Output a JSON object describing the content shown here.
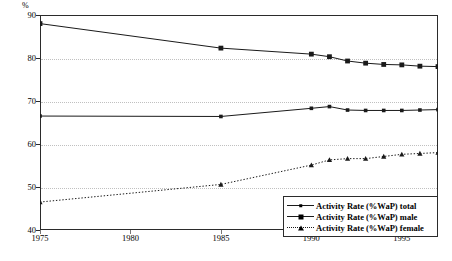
{
  "figure": {
    "cropped_title_text": "",
    "y_axis_unit_label": "%"
  },
  "chart_data": {
    "type": "line",
    "title": "",
    "xlabel": "",
    "ylabel": "%",
    "xlim": [
      1975,
      1997
    ],
    "ylim": [
      40,
      90
    ],
    "yticks": [
      40,
      50,
      60,
      70,
      80,
      90
    ],
    "xticks": [
      1975,
      1980,
      1985,
      1990,
      1995
    ],
    "grid": "horizontal-dotted",
    "legend_position": "bottom-right",
    "x": [
      1975,
      1985,
      1990,
      1991,
      1992,
      1993,
      1994,
      1995,
      1996,
      1997
    ],
    "series": [
      {
        "name": "Activity Rate (%WaP) total",
        "marker": "small-square",
        "line": "solid",
        "color": "#1a1a1a",
        "values": [
          66.5,
          66.4,
          68.3,
          68.7,
          67.9,
          67.8,
          67.8,
          67.8,
          67.9,
          68.0
        ]
      },
      {
        "name": "Activity Rate (%WaP) male",
        "marker": "large-square",
        "line": "solid",
        "color": "#1a1a1a",
        "values": [
          88.0,
          82.3,
          80.9,
          80.3,
          79.3,
          78.8,
          78.5,
          78.4,
          78.1,
          78.0
        ]
      },
      {
        "name": "Activity Rate (%WaP) female",
        "marker": "triangle",
        "line": "dotted",
        "color": "#1a1a1a",
        "values": [
          46.5,
          50.6,
          55.1,
          56.3,
          56.6,
          56.6,
          57.1,
          57.6,
          57.8,
          58.0
        ]
      }
    ]
  },
  "legend": {
    "items": [
      {
        "label": "Activity Rate (%WaP) total"
      },
      {
        "label": "Activity Rate (%WaP) male"
      },
      {
        "label": "Activity Rate (%WaP) female"
      }
    ]
  },
  "axis": {
    "y_labels": [
      "90",
      "80",
      "70",
      "60",
      "50",
      "40"
    ],
    "x_labels": [
      "1975",
      "1980",
      "1985",
      "1990",
      "1995"
    ]
  }
}
